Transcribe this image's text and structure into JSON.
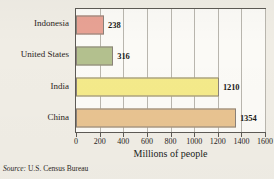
{
  "chart_data": {
    "type": "bar",
    "orientation": "horizontal",
    "title": "",
    "xlabel": "Millions of people",
    "ylabel": "",
    "categories": [
      "Indonesia",
      "United States",
      "India",
      "China"
    ],
    "values": [
      238,
      316,
      1210,
      1354
    ],
    "value_labels": [
      "238",
      "316",
      "1210",
      "1354"
    ],
    "bar_colors": [
      "#e8a294",
      "#b3c08e",
      "#f4ea8a",
      "#e8c391"
    ],
    "bar_edge_color": "#8a8179",
    "xlim": [
      0,
      1600
    ],
    "xticks": [
      0,
      200,
      400,
      600,
      800,
      1000,
      1200,
      1400,
      1600
    ],
    "xticklabels": [
      "0",
      "200",
      "400",
      "600",
      "800",
      "1000",
      "1200",
      "1400",
      "1600"
    ],
    "grid": "vertical",
    "legend": "none",
    "source_prefix": "Source:",
    "source_text": "U.S. Census Bureau",
    "plot_background": "#fbfaf6",
    "figure_background": "#f0ede5",
    "axis_color": "#5d5a55",
    "gridline_color": "#b9b6ae"
  }
}
